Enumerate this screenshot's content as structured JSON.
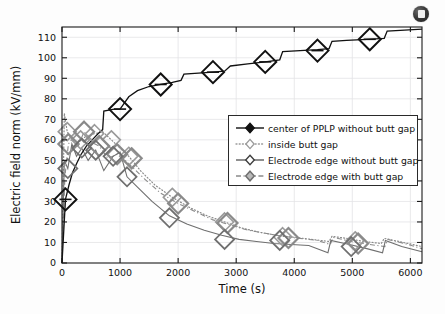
{
  "badge": {
    "icon": "dark-disc-icon"
  },
  "legend": {
    "position": "center-right",
    "entries": [
      {
        "label": "center of PPLP without butt gap",
        "style": "solid",
        "color": "#111111",
        "marker": "diamond-filled-center"
      },
      {
        "label": "inside butt gap",
        "style": "dotted",
        "color": "#9a9a9a",
        "marker": "diamond-open"
      },
      {
        "label": "Electrode edge without butt gap",
        "style": "solid",
        "color": "#6f6f6f",
        "marker": "diamond-open"
      },
      {
        "label": "Electrode edge with butt gap",
        "style": "dash-dot",
        "color": "#8a8a8a",
        "marker": "diamond-shaded"
      }
    ]
  },
  "chart_data": {
    "type": "line",
    "title": "",
    "xlabel": "Time (s)",
    "ylabel": "Electric field norm (kV/mm)",
    "xlim": [
      0,
      6200
    ],
    "ylim": [
      0,
      115
    ],
    "xticks": [
      0,
      1000,
      2000,
      3000,
      4000,
      5000,
      6000
    ],
    "yticks": [
      0,
      10,
      20,
      30,
      40,
      50,
      60,
      70,
      80,
      90,
      100,
      110
    ],
    "grid": true,
    "legend_position": "center-right",
    "series": [
      {
        "name": "center of PPLP without butt gap",
        "color": "#111111",
        "linestyle": "solid",
        "marker": "diamond",
        "x": [
          0,
          60,
          120,
          180,
          260,
          330,
          420,
          520,
          620,
          700,
          720,
          900,
          1000,
          1150,
          1300,
          1500,
          1700,
          1900,
          2050,
          2100,
          2350,
          2600,
          2800,
          2900,
          3200,
          3500,
          3750,
          3800,
          4100,
          4400,
          4600,
          4650,
          4900,
          5250,
          5550,
          5600,
          5900,
          6200
        ],
        "y": [
          0,
          31,
          38,
          44,
          49,
          53,
          57,
          60,
          63,
          65,
          74,
          75,
          75,
          81,
          84,
          86,
          87,
          88,
          89,
          92,
          92.5,
          93,
          93.5,
          96,
          97,
          98,
          99,
          103,
          103.5,
          104,
          104.5,
          108,
          108.5,
          109,
          109.5,
          113,
          113.5,
          114
        ],
        "markers_x": [
          60,
          1000,
          1700,
          2600,
          3500,
          4400,
          5300
        ],
        "markers_y": [
          31,
          75,
          87,
          93,
          98,
          103.5,
          109
        ]
      },
      {
        "name": "inside butt gap",
        "color": "#9a9a9a",
        "linestyle": "dotted",
        "marker": "diamond",
        "x": [
          0,
          40,
          90,
          150,
          230,
          320,
          430,
          560,
          700,
          850,
          1000,
          1150,
          1350,
          1600,
          1900,
          2200,
          2500,
          2800,
          3100,
          3400,
          3700,
          4000,
          4300,
          4600,
          4650,
          4900,
          5200,
          5500,
          5550,
          5800,
          6200
        ],
        "y": [
          0,
          73,
          64,
          61,
          59,
          60,
          62,
          63,
          64,
          60,
          56,
          52,
          45,
          38,
          32,
          27,
          23,
          20,
          17,
          15,
          13.5,
          12.5,
          11.5,
          10.5,
          13,
          12,
          10.5,
          9.5,
          12,
          10.5,
          8
        ],
        "markers_x": [
          90,
          320,
          560,
          850,
          1150,
          1900,
          2800,
          3800,
          5050
        ],
        "markers_y": [
          64,
          60,
          63,
          60,
          52,
          32,
          20,
          12.8,
          10.8
        ]
      },
      {
        "name": "Electrode edge without butt gap",
        "color": "#6f6f6f",
        "linestyle": "solid",
        "marker": "diamond",
        "x": [
          0,
          40,
          100,
          170,
          250,
          340,
          450,
          580,
          720,
          880,
          1000,
          1120,
          1300,
          1550,
          1850,
          2150,
          2450,
          2750,
          3050,
          3350,
          3650,
          3950,
          4250,
          4580,
          4630,
          4950,
          5250,
          5520,
          5570,
          5850,
          6200
        ],
        "y": [
          0,
          50,
          46,
          58,
          52,
          56,
          50,
          55,
          45,
          52,
          54,
          42,
          37,
          30,
          23,
          19,
          16,
          13.5,
          11.5,
          10.5,
          9.5,
          9,
          8.5,
          5,
          11,
          9,
          7,
          5,
          11,
          8,
          5.5
        ],
        "markers_x": [
          100,
          340,
          580,
          880,
          1120,
          1850,
          2800,
          3750,
          4980
        ],
        "markers_y": [
          46,
          56,
          55,
          52,
          42,
          22,
          11.5,
          11,
          8
        ]
      },
      {
        "name": "Electrode edge with butt gap",
        "color": "#8a8a8a",
        "linestyle": "dash-dot",
        "marker": "diamond",
        "x": [
          0,
          50,
          110,
          190,
          280,
          380,
          500,
          640,
          790,
          950,
          1050,
          1200,
          1420,
          1700,
          2000,
          2300,
          2600,
          2900,
          3200,
          3500,
          3800,
          4100,
          4400,
          4620,
          4670,
          4980,
          5300,
          5560,
          5610,
          5900,
          6200
        ],
        "y": [
          0,
          42,
          58,
          61,
          57,
          64,
          59,
          57,
          51,
          53,
          51,
          47,
          41,
          34,
          29,
          25,
          21,
          18.5,
          16,
          14.5,
          13,
          12,
          11,
          9,
          12.5,
          10.5,
          9,
          8,
          11.5,
          9.5,
          7
        ],
        "markers_x": [
          110,
          380,
          640,
          950,
          1200,
          2000,
          2850,
          3900,
          5100
        ],
        "markers_y": [
          58,
          64,
          57,
          53,
          51,
          29,
          19.5,
          12.2,
          9.5
        ]
      }
    ]
  }
}
